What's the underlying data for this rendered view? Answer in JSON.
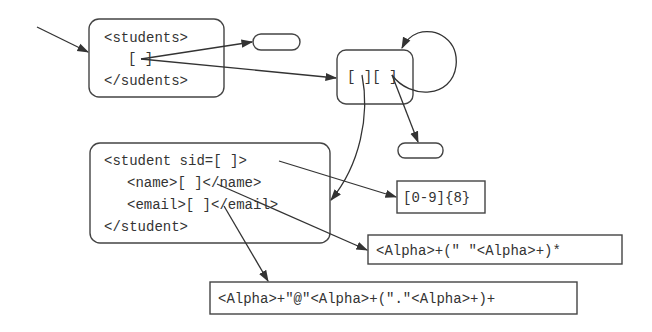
{
  "diagram": {
    "students_node": {
      "lines": [
        "<students>",
        "[ ]",
        "</sudents>"
      ]
    },
    "pair_node": {
      "label": "[ ][ ]"
    },
    "student_node": {
      "lines": [
        "<student sid=[ ]>",
        "<name>[ ]</name>",
        "<email>[ ]</email>",
        "</student>"
      ]
    },
    "sid_regex": "[0-9]{8}",
    "name_regex": "<Alpha>+(\" \"<Alpha>+)*",
    "email_regex": "<Alpha>+\"@\"<Alpha>+(\".\"<Alpha>+)+",
    "colors": {
      "stroke": "#444444",
      "text": "#333333",
      "background": "#ffffff"
    }
  }
}
